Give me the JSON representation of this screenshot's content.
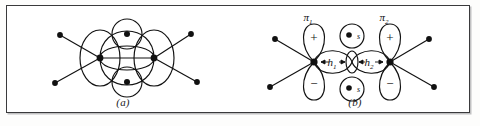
{
  "figure": {
    "panels": [
      {
        "id": "a",
        "caption": "(a)",
        "description": "bent-bond (banana bond) picture of the ethylene double bond",
        "atoms": [
          {
            "name": "carbon-left",
            "label": ""
          },
          {
            "name": "carbon-right",
            "label": ""
          },
          {
            "name": "hydrogen-top",
            "label": ""
          },
          {
            "name": "hydrogen-bottom",
            "label": ""
          }
        ],
        "substituent_count": 4
      },
      {
        "id": "b",
        "caption": "(b)",
        "description": "pi orbital plus sigma hybrid picture of the ethylene double bond",
        "orbital_labels": {
          "pi_left": "π",
          "pi_left_sub": "1",
          "pi_right": "π",
          "pi_right_sub": "2",
          "hybrid_left": "h",
          "hybrid_left_sub": "1",
          "hybrid_right": "h",
          "hybrid_right_sub": "2",
          "s_top": "s",
          "s_bottom": "s"
        },
        "lobe_signs": {
          "left_upper": "+",
          "left_lower": "−",
          "right_upper": "+",
          "right_lower": "−"
        }
      }
    ]
  },
  "colors": {
    "ink": "#111111",
    "frame": "#3a3a3c",
    "paper": "#ffffff",
    "page": "#fdfdfc"
  }
}
